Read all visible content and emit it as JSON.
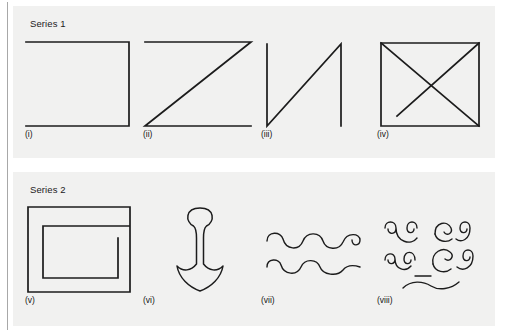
{
  "figure": {
    "background_color": "#ffffff",
    "panel_background_color": "#f1f1f0",
    "ink_color": "#1c1c1c",
    "rule_color": "#a8a8a8"
  },
  "panels": [
    {
      "title": "Series 1",
      "figures": [
        {
          "label": "(i)",
          "shape_name": "open-square-left-side-missing",
          "description": "Square outline with the left side omitted: top edge, right edge and bottom edge drawn."
        },
        {
          "label": "(ii)",
          "shape_name": "zigzag-z-shape",
          "description": "Z shape: top horizontal line, diagonal from top-left down to bottom-right, bottom horizontal line."
        },
        {
          "label": "(iii)",
          "shape_name": "n-shape-with-diagonal",
          "description": "N shape: left vertical line, diagonal rising from bottom-left to top-right, right vertical line."
        },
        {
          "label": "(iv)",
          "shape_name": "square-with-both-diagonals",
          "description": "Square outline containing both diagonals forming an X."
        }
      ]
    },
    {
      "title": "Series 2",
      "figures": [
        {
          "label": "(v)",
          "shape_name": "rectangular-spiral",
          "description": "Nested rectangular spiral drawn as one continuous squared coil."
        },
        {
          "label": "(vi)",
          "shape_name": "anchor",
          "description": "Anchor motif: round ring at top, tapered shank, curved flukes with a point at the bottom."
        },
        {
          "label": "(vii)",
          "shape_name": "two-wavy-lines-with-curl",
          "description": "Two horizontal wavy squiggle lines, the upper one ending in a spiral curl."
        },
        {
          "label": "(viii)",
          "shape_name": "scattered-scroll-curls",
          "description": "Cluster of small scroll/curl motifs with a short wavy line beneath."
        }
      ]
    }
  ]
}
